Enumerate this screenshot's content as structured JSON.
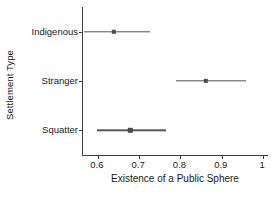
{
  "chart_data": {
    "type": "scatter",
    "title": "",
    "xlabel": "Existence of a Public Sphere",
    "ylabel": "Settlement Type",
    "xlim": [
      0.564,
      1.012
    ],
    "xticks": [
      0.6,
      0.7,
      0.8,
      0.9,
      1
    ],
    "xticklabels": [
      "0.6",
      "0.7",
      "0.8",
      "0.9",
      "1"
    ],
    "categories": [
      "Indigenous",
      "Stranger",
      "Squatter"
    ],
    "grid": false,
    "legend": null,
    "series": [
      {
        "name": "Estimate with confidence interval",
        "points": [
          {
            "category": "Indigenous",
            "value": 0.638,
            "ci_low": 0.566,
            "ci_high": 0.727
          },
          {
            "category": "Stranger",
            "value": 0.862,
            "ci_low": 0.79,
            "ci_high": 0.958
          },
          {
            "category": "Squatter",
            "value": 0.679,
            "ci_low": 0.598,
            "ci_high": 0.766
          }
        ]
      }
    ],
    "colors": {
      "point": "#4a4a4a",
      "interval": "#555555",
      "axis": "#3d3d3d",
      "text": "#1a1a1a",
      "background": "#ffffff"
    }
  },
  "axes": {
    "x_title": "Existence of a Public Sphere",
    "y_title": "Settlement Type",
    "x_tick_labels": [
      "0.6",
      "0.7",
      "0.8",
      "0.9",
      "1"
    ],
    "y_tick_labels": [
      "Indigenous",
      "Stranger",
      "Squatter"
    ]
  }
}
